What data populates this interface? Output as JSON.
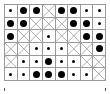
{
  "grid": {
    "rows": 6,
    "cols": 8,
    "legend": {
      "X": "crossed cell",
      "S": "small dot",
      "L": "large dot"
    },
    "cells": [
      [
        "S",
        "L",
        "L",
        "X",
        "L",
        "L",
        "S",
        "S"
      ],
      [
        "L",
        "L",
        "X",
        "X",
        "X",
        "L",
        "L",
        "S"
      ],
      [
        "L",
        "X",
        "X",
        "S",
        "X",
        "X",
        "L",
        "L"
      ],
      [
        "X",
        "X",
        "S",
        "S",
        "S",
        "X",
        "X",
        "L"
      ],
      [
        "X",
        "S",
        "S",
        "L",
        "S",
        "S",
        "X",
        "X"
      ],
      [
        "S",
        "S",
        "L",
        "L",
        "L",
        "S",
        "S",
        "X"
      ]
    ],
    "colors": {
      "line": "#9a9a9a",
      "dot": "#000000",
      "cross": "#8a8a8a"
    }
  },
  "ticks": [
    {
      "x": 4
    },
    {
      "x": 105
    }
  ]
}
